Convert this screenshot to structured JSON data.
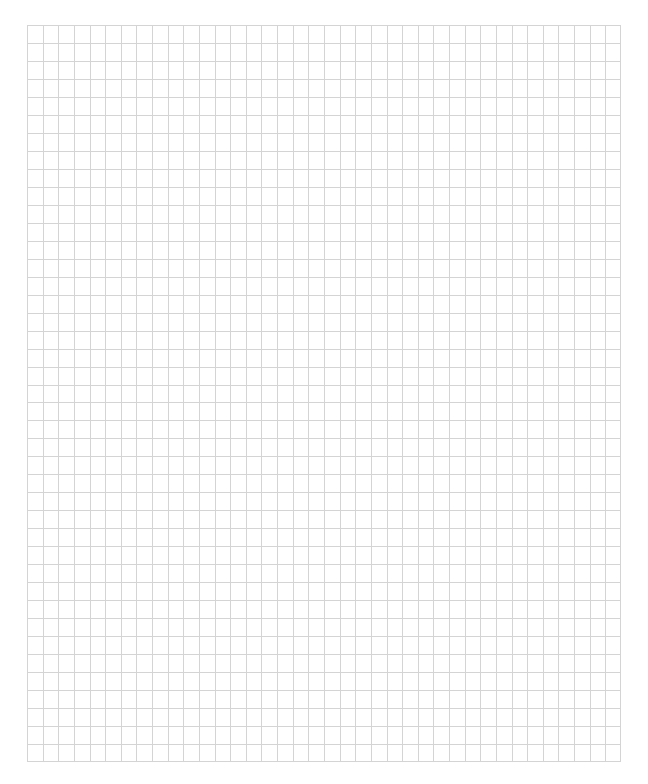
{
  "page": {
    "type": "grid-paper",
    "background_color": "#ffffff"
  },
  "grid": {
    "columns": 38,
    "rows": 41,
    "left": 27,
    "top": 25,
    "width": 594,
    "height": 737,
    "line_color": "#d4d4d4",
    "line_width": 1
  }
}
